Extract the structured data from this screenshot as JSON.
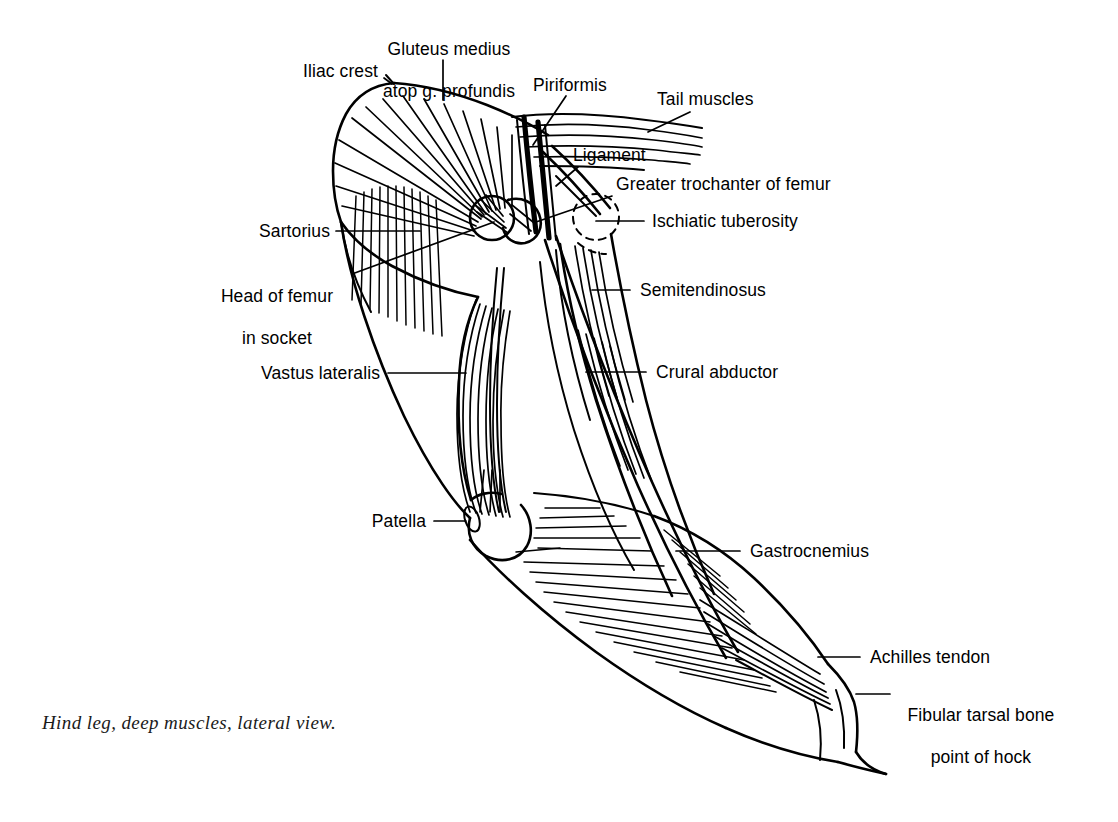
{
  "figure": {
    "title": "Hind leg, deep muscles, lateral view.",
    "view": "lateral",
    "ink_color": "#000000",
    "background_color": "#ffffff"
  },
  "caption": {
    "text": "Hind leg, deep muscles, lateral view."
  },
  "labels": [
    {
      "id": "iliac-crest",
      "text": "Iliac crest"
    },
    {
      "id": "gluteus-medius",
      "line1": "Gluteus medius",
      "line2": "atop g. profundis"
    },
    {
      "id": "piriformis",
      "text": "Piriformis"
    },
    {
      "id": "tail-muscles",
      "text": "Tail muscles"
    },
    {
      "id": "ligament",
      "text": "Ligament"
    },
    {
      "id": "greater-trochanter",
      "text": "Greater trochanter of femur"
    },
    {
      "id": "ischiatic-tuberosity",
      "text": "Ischiatic tuberosity"
    },
    {
      "id": "sartorius",
      "text": "Sartorius"
    },
    {
      "id": "head-of-femur",
      "line1": "Head of femur",
      "line2": "in socket"
    },
    {
      "id": "semitendinosus",
      "text": "Semitendinosus"
    },
    {
      "id": "vastus-lateralis",
      "text": "Vastus lateralis"
    },
    {
      "id": "crural-abductor",
      "text": "Crural abductor"
    },
    {
      "id": "patella",
      "text": "Patella"
    },
    {
      "id": "gastrocnemius",
      "text": "Gastrocnemius"
    },
    {
      "id": "achilles-tendon",
      "text": "Achilles tendon"
    },
    {
      "id": "fibular-tarsal-bone",
      "line1": "Fibular tarsal bone",
      "line2": "point of hock"
    }
  ]
}
